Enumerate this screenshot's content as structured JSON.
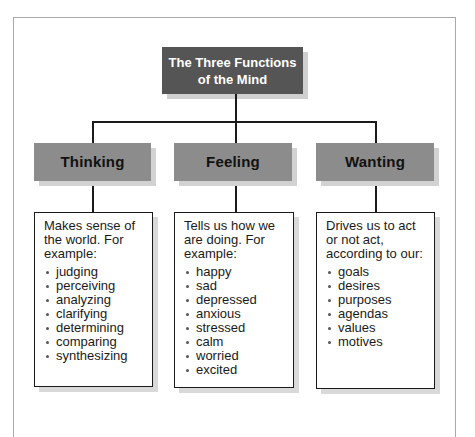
{
  "title": {
    "line1": "The Three Functions",
    "line2": "of the Mind"
  },
  "functions": [
    {
      "label": "Thinking",
      "description": "Makes sense of the world. For example:",
      "items": [
        "judging",
        "perceiving",
        "analyzing",
        "clarifying",
        "determining",
        "comparing",
        "synthesizing"
      ]
    },
    {
      "label": "Feeling",
      "description": "Tells us how we are doing. For example:",
      "items": [
        "happy",
        "sad",
        "depressed",
        "anxious",
        "stressed",
        "calm",
        "worried",
        "excited"
      ]
    },
    {
      "label": "Wanting",
      "description": "Drives us to act or not act, according to our:",
      "items": [
        "goals",
        "desires",
        "purposes",
        "agendas",
        "values",
        "motives"
      ]
    }
  ],
  "colors": {
    "title_bg": "#555555",
    "header_bg": "#8c8c8c",
    "shadow": "#d2d2d2",
    "line": "#1a1a1a"
  }
}
